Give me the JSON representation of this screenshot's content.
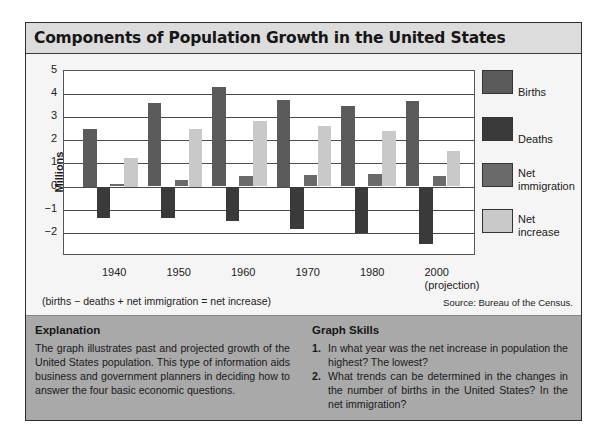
{
  "title": "Components of Population Growth in the United States",
  "chart_data": {
    "type": "bar",
    "title": "Components of Population Growth in the United States",
    "xlabel": "",
    "ylabel": "Millions",
    "ylim": [
      -3,
      5
    ],
    "yticks": [
      5,
      4,
      3,
      2,
      1,
      0,
      -1,
      -2
    ],
    "ytick_labels": [
      "5",
      "4",
      "3",
      "2",
      "1",
      "0",
      "−1",
      "−2"
    ],
    "grid": true,
    "legend_position": "right",
    "categories": [
      "1940",
      "1950",
      "1960",
      "1970",
      "1980",
      "2000 (projection)"
    ],
    "category_labels": [
      {
        "line1": "1940",
        "line2": ""
      },
      {
        "line1": "1950",
        "line2": ""
      },
      {
        "line1": "1960",
        "line2": ""
      },
      {
        "line1": "1970",
        "line2": ""
      },
      {
        "line1": "1980",
        "line2": ""
      },
      {
        "line1": "2000",
        "line2": "(projection)"
      }
    ],
    "series": [
      {
        "name": "Births",
        "color": "#5b5b5b",
        "values": [
          2.5,
          3.6,
          4.3,
          3.75,
          3.5,
          3.7
        ]
      },
      {
        "name": "Deaths",
        "color": "#3a3a3a",
        "values": [
          -1.35,
          -1.35,
          -1.5,
          -1.85,
          -2.0,
          -2.5
        ]
      },
      {
        "name": "Net immigration",
        "color": "#6a6a6a",
        "values": [
          0.1,
          0.3,
          0.45,
          0.5,
          0.55,
          0.45
        ]
      },
      {
        "name": "Net increase",
        "color": "#c9c9c9",
        "values": [
          1.25,
          2.5,
          2.85,
          2.6,
          2.4,
          1.55
        ]
      }
    ],
    "annotations": [
      "(births − deaths + net immigration = net increase)",
      "Source: Bureau of the Census."
    ]
  },
  "legend": [
    {
      "line1": "Births",
      "line2": ""
    },
    {
      "line1": "Deaths",
      "line2": ""
    },
    {
      "line1": "Net",
      "line2": "immigration"
    },
    {
      "line1": "Net",
      "line2": "increase"
    }
  ],
  "formula": "(births − deaths + net immigration = net increase)",
  "source": "Source: Bureau of the Census.",
  "explanation": {
    "heading": "Explanation",
    "text": "The graph illustrates past and projected growth of the United States population. This type of information aids business and government planners in deciding how to answer the four basic economic questions."
  },
  "graph_skills": {
    "heading": "Graph Skills",
    "questions": [
      {
        "num": "1.",
        "text": "In what year was the net increase in population the highest? The lowest?"
      },
      {
        "num": "2.",
        "text": "What trends can be determined in the changes in the number of births in the United States? In the net immigration?"
      }
    ]
  }
}
